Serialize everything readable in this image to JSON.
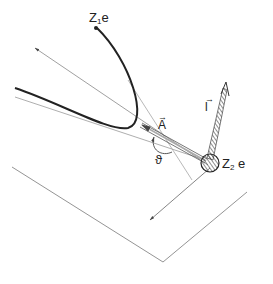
{
  "figure": {
    "type": "scattering-geometry-diagram",
    "labels": {
      "projectile": {
        "main": "Z",
        "sub": "1",
        "suffix": "e"
      },
      "target": {
        "main": "Z",
        "sub": "2",
        "suffix": "e"
      },
      "vector_A": "A",
      "vector_l": "l",
      "angle": "ϑ"
    },
    "colors": {
      "stroke": "#333333",
      "thin_stroke": "#777777",
      "background": "#ffffff"
    }
  }
}
